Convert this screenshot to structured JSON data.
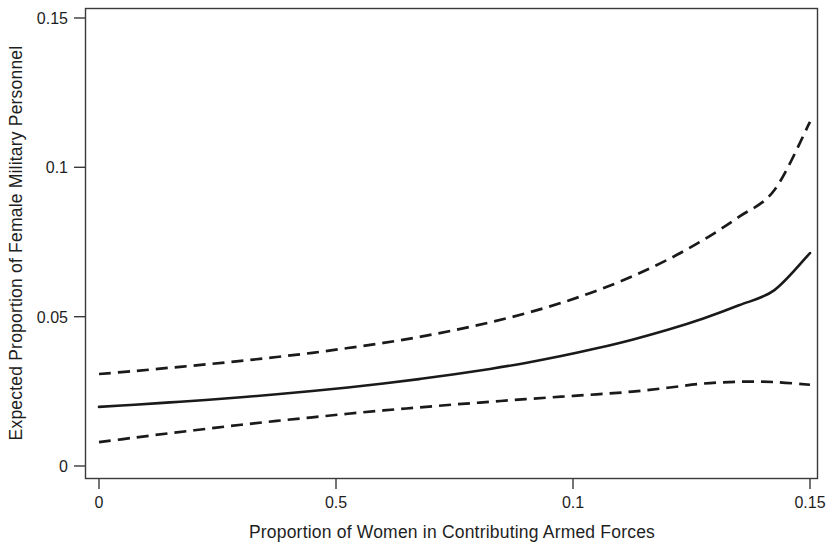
{
  "chart_data": {
    "type": "line",
    "title": "",
    "subtitle": "",
    "xlabel": "Proportion of Women in Contributing Armed Forces",
    "ylabel": "Expected Proportion of Female Military Personnel",
    "xlim": [
      0,
      0.15
    ],
    "ylim": [
      0,
      0.15
    ],
    "grid": false,
    "legend": "none",
    "x_tick_labels": [
      "0",
      "0.5",
      "0.1",
      "0.15"
    ],
    "x_tick_values": [
      0,
      0.05,
      0.1,
      0.15
    ],
    "y_tick_labels": [
      "0",
      "0.05",
      "0.1",
      "0.15"
    ],
    "y_tick_values": [
      0,
      0.05,
      0.1,
      0.15
    ],
    "x": [
      0,
      0.0075,
      0.015,
      0.0225,
      0.03,
      0.0375,
      0.045,
      0.0525,
      0.06,
      0.0675,
      0.075,
      0.0825,
      0.09,
      0.0975,
      0.105,
      0.1125,
      0.12,
      0.1275,
      0.135,
      0.1425,
      0.15
    ],
    "series": [
      {
        "name": "Upper 95% confidence bound",
        "style": "dashed",
        "color": "#1a1a1a",
        "values": [
          0.0308,
          0.0318,
          0.0329,
          0.034,
          0.0352,
          0.0365,
          0.0379,
          0.0395,
          0.0412,
          0.0432,
          0.0455,
          0.0481,
          0.0511,
          0.0546,
          0.0587,
          0.0635,
          0.0691,
          0.0757,
          0.0834,
          0.0924,
          0.1152
        ]
      },
      {
        "name": "Expected proportion (point estimate)",
        "style": "solid",
        "color": "#1a1a1a",
        "values": [
          0.0198,
          0.0205,
          0.0213,
          0.0221,
          0.023,
          0.024,
          0.0251,
          0.0263,
          0.0276,
          0.0291,
          0.0307,
          0.0325,
          0.0345,
          0.0368,
          0.0394,
          0.0423,
          0.0456,
          0.0494,
          0.0538,
          0.0589,
          0.0713
        ]
      },
      {
        "name": "Lower 95% confidence bound",
        "style": "dashed",
        "color": "#1a1a1a",
        "values": [
          0.008,
          0.0095,
          0.011,
          0.0124,
          0.0138,
          0.0151,
          0.0163,
          0.0175,
          0.0186,
          0.0196,
          0.0206,
          0.0215,
          0.0224,
          0.0232,
          0.024,
          0.0249,
          0.0262,
          0.0276,
          0.0282,
          0.0281,
          0.0272
        ]
      }
    ]
  },
  "axes": {
    "x_title": "Proportion of Women in Contributing Armed Forces",
    "y_title": "Expected Proportion of Female Military Personnel"
  },
  "ticks": {
    "x": [
      {
        "label": "0",
        "value": 0
      },
      {
        "label": "0.5",
        "value": 0.05
      },
      {
        "label": "0.1",
        "value": 0.1
      },
      {
        "label": "0.15",
        "value": 0.15
      }
    ],
    "y": [
      {
        "label": "0",
        "value": 0
      },
      {
        "label": "0.05",
        "value": 0.05
      },
      {
        "label": "0.1",
        "value": 0.1
      },
      {
        "label": "0.15",
        "value": 0.15
      }
    ]
  },
  "style": {
    "background": "#ffffff",
    "ink": "#1a1a1a",
    "frame": "#3a3a3a"
  }
}
